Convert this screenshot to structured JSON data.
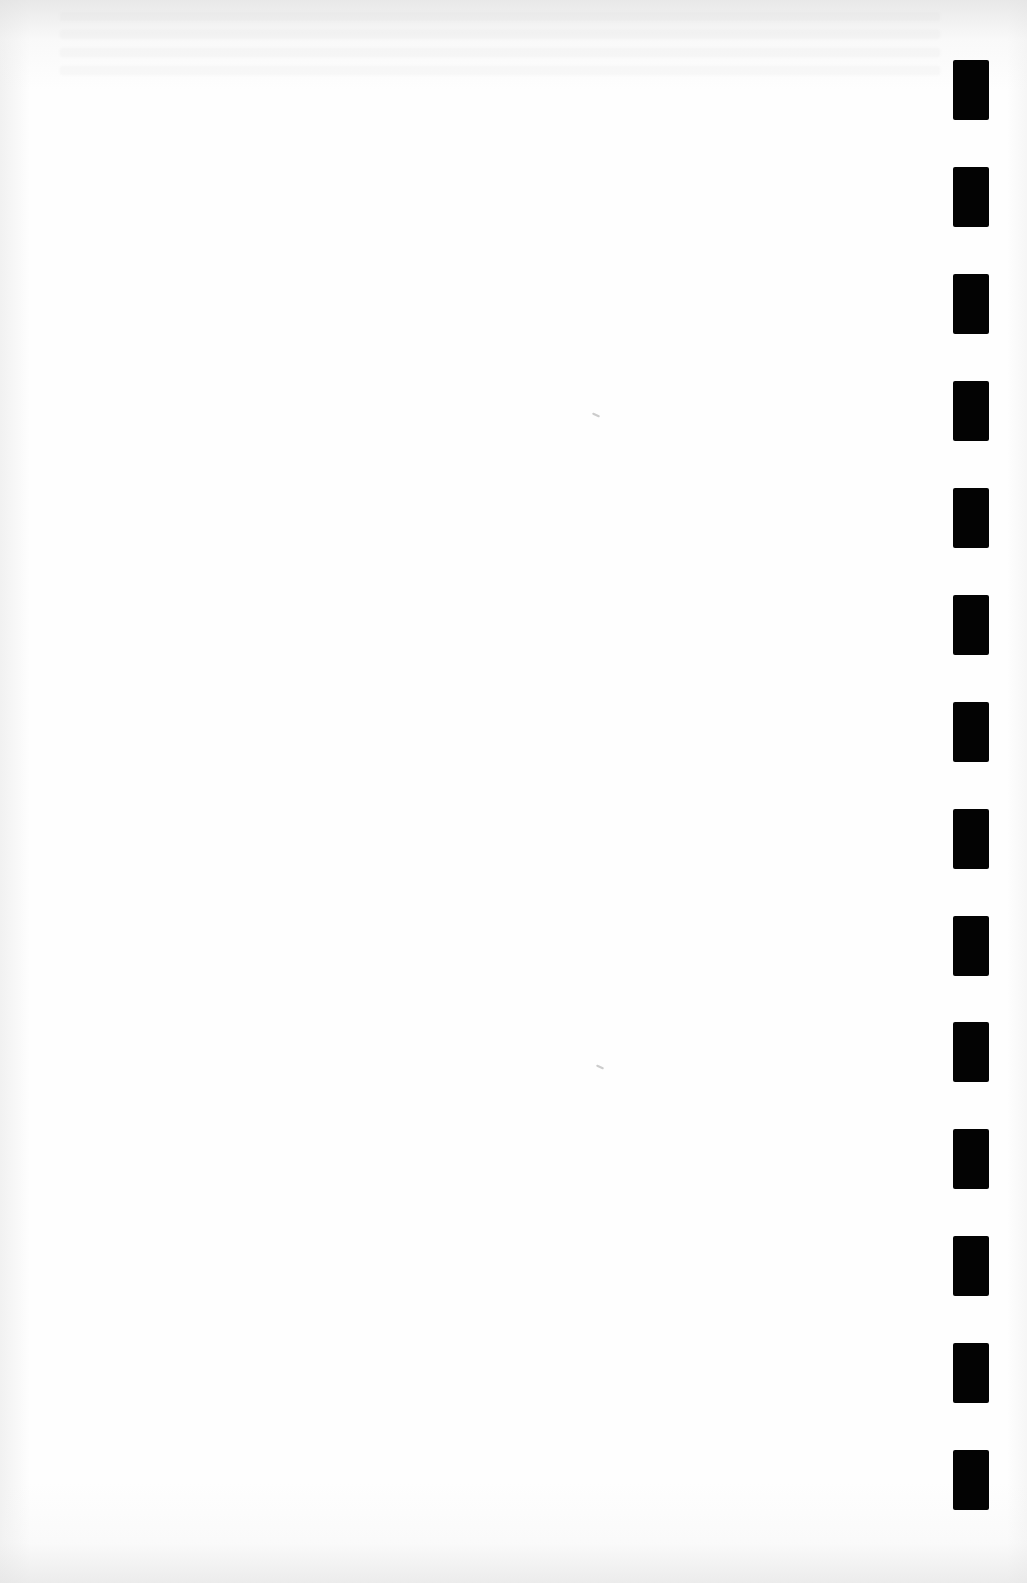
{
  "document": {
    "type": "blank scanned page",
    "background_color": "#fefefe",
    "text_content": "",
    "bleed_through_text_legible": false
  },
  "binding_marks": {
    "color": "#030303",
    "x": 953,
    "width": 36,
    "height": 60,
    "count": 14,
    "tops": [
      60,
      167,
      274,
      381,
      488,
      595,
      702,
      809,
      916,
      1022,
      1129,
      1236,
      1343,
      1450
    ]
  },
  "specks": [
    {
      "x": 592,
      "y": 414
    },
    {
      "x": 596,
      "y": 1066
    }
  ]
}
